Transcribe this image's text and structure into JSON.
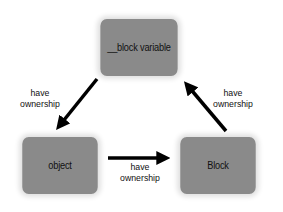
{
  "diagram": {
    "type": "ownership-cycle",
    "nodes": [
      {
        "id": "block-variable",
        "label": "__block variable"
      },
      {
        "id": "object",
        "label": "object"
      },
      {
        "id": "block",
        "label": "Block"
      }
    ],
    "edges": [
      {
        "from": "block-variable",
        "to": "object",
        "label_line1": "have",
        "label_line2": "ownership"
      },
      {
        "from": "object",
        "to": "block",
        "label_line1": "have",
        "label_line2": "ownership"
      },
      {
        "from": "block",
        "to": "block-variable",
        "label_line1": "have",
        "label_line2": "ownership"
      }
    ],
    "colors": {
      "node_fill": "#8a8a8a",
      "arrow": "#000000",
      "text": "#111111",
      "background": "#ffffff"
    }
  }
}
